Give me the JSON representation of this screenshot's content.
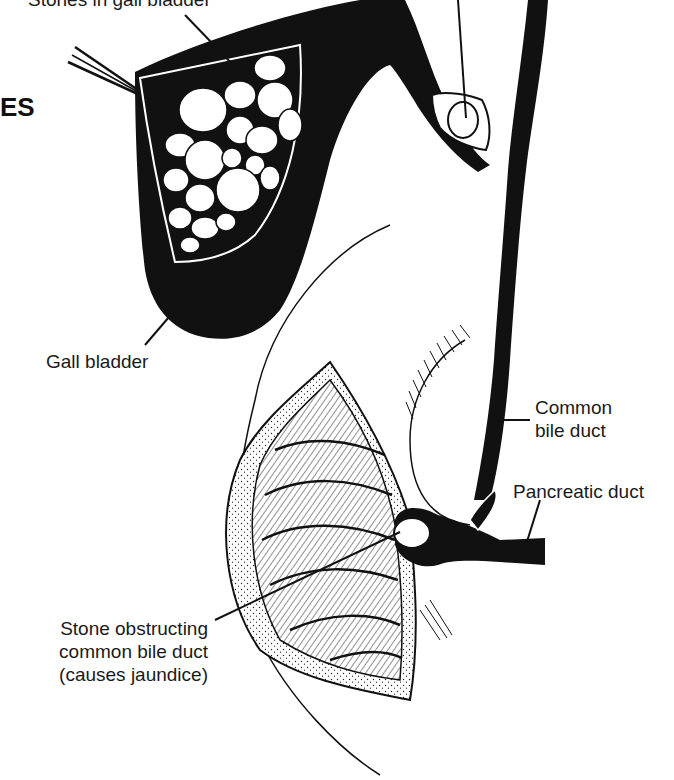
{
  "diagram": {
    "heading_fragment": "ES",
    "labels": {
      "stones_in_gall_bladder": "Stones in gall bladder",
      "gall_bladder": "Gall bladder",
      "common_bile_duct_line1": "Common",
      "common_bile_duct_line2": "bile duct",
      "pancreatic_duct": "Pancreatic duct",
      "stone_obstructing_line1": "Stone obstructing",
      "stone_obstructing_line2": "common bile duct",
      "stone_obstructing_line3": "(causes jaundice)"
    },
    "colors": {
      "ink": "#111111",
      "paper": "#ffffff"
    }
  }
}
